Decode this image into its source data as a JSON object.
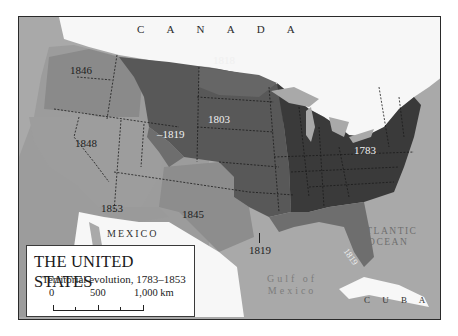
{
  "map": {
    "title": "THE UNITED STATES",
    "subtitle": "Territorial evolution, 1783–1853",
    "scale": {
      "ticks": [
        "0",
        "500",
        "1,000 km"
      ],
      "unit": "km"
    },
    "place_labels": {
      "canada": "C A N A D A",
      "mexico": "MEXICO",
      "atlantic_line1": "ATLANTIC",
      "atlantic_line2": "OCEAN",
      "gulf_line1": "Gulf of",
      "gulf_line2": "Mexico",
      "cuba": "C U B A"
    },
    "territories": [
      {
        "year": "1783",
        "name": "Original territory",
        "shade": "#3a3a3a"
      },
      {
        "year": "1803",
        "name": "Louisiana Purchase",
        "shade": "#555555"
      },
      {
        "year": "1818",
        "name": "Red River cession",
        "shade": "#6a6a6a"
      },
      {
        "year": "1819",
        "name": "Florida / Adams–Onís Treaty",
        "shade": "#6e6e6e"
      },
      {
        "year": "1845",
        "name": "Texas annexation",
        "shade": "#8d8d8d"
      },
      {
        "year": "1846",
        "name": "Oregon Territory",
        "shade": "#8a8a8a"
      },
      {
        "year": "1848",
        "name": "Mexican Cession",
        "shade": "#9b9b9b"
      },
      {
        "year": "1853",
        "name": "Gadsden Purchase",
        "shade": "#9a9a9a"
      }
    ],
    "year_labels": {
      "y1846": "1846",
      "y1818": "1818",
      "y1803": "1803",
      "y1819_west": "1819",
      "y1848": "1848",
      "y1783": "1783",
      "y1853": "1853",
      "y1845": "1845",
      "y1819_south": "1819",
      "y1819_florida": "1819"
    },
    "colors": {
      "water": "#a9a9a9",
      "foreign_land": "#ffffff",
      "frame": "#2a2a2a"
    }
  }
}
